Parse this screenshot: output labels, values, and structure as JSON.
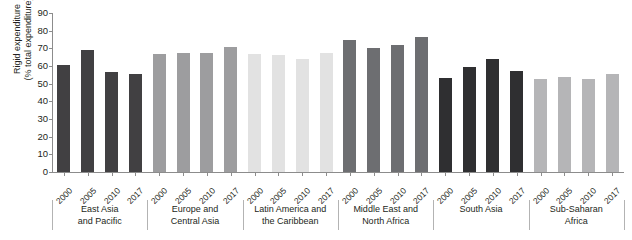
{
  "chart_data": {
    "type": "bar",
    "title": "",
    "xlabel": "",
    "ylabel": "Rigid expenditure\n(% total expenditure)",
    "ylim": [
      0,
      90
    ],
    "yticks": [
      0,
      10,
      20,
      30,
      40,
      50,
      60,
      70,
      80,
      90
    ],
    "grid": false,
    "legend": "none",
    "categories": [
      "2000",
      "2005",
      "2010",
      "2017"
    ],
    "groups": [
      {
        "name": "East Asia\nand Pacific",
        "color": "#414042",
        "values": [
          60.5,
          69.0,
          56.5,
          55.5
        ]
      },
      {
        "name": "Europe and\nCentral Asia",
        "color": "#9d9d9f",
        "values": [
          67.0,
          67.5,
          67.5,
          71.0
        ]
      },
      {
        "name": "Latin America and\nthe Caribbean",
        "color": "#e2e2e2",
        "values": [
          67.0,
          66.5,
          64.0,
          67.5
        ]
      },
      {
        "name": "Middle East and\nNorth Africa",
        "color": "#6d6e71",
        "values": [
          74.5,
          70.0,
          72.0,
          76.5
        ]
      },
      {
        "name": "South Asia",
        "color": "#2f2f31",
        "values": [
          53.0,
          59.5,
          64.0,
          57.0
        ]
      },
      {
        "name": "Sub-Saharan\nAfrica",
        "color": "#b5b5b7",
        "values": [
          52.5,
          54.0,
          52.5,
          55.5
        ]
      }
    ]
  }
}
